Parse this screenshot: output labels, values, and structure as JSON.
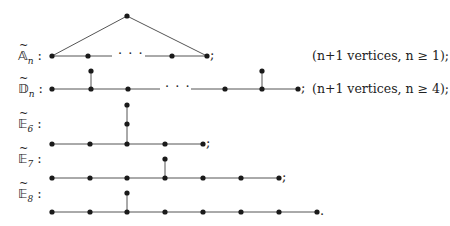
{
  "diagram": {
    "colors": {
      "node": "#1a1a1a",
      "edge": "#555555",
      "text": "#222222"
    },
    "rows": [
      {
        "id": "A_n",
        "label_main": "𝔸",
        "label_sub": "n",
        "label_suffix": ":",
        "note": "(n+1 vertices, n ≥ 1);",
        "terminal": ";",
        "ellipsis": "· · ·"
      },
      {
        "id": "D_n",
        "label_main": "𝔻",
        "label_sub": "n",
        "label_suffix": ":",
        "note": "(n+1 vertices, n ≥ 4);",
        "terminal": ";",
        "ellipsis": "· · ·"
      },
      {
        "id": "E_6",
        "label_main": "𝔼",
        "label_sub": "6",
        "label_suffix": ":",
        "terminal": ";"
      },
      {
        "id": "E_7",
        "label_main": "𝔼",
        "label_sub": "7",
        "label_suffix": ":",
        "terminal": ";"
      },
      {
        "id": "E_8",
        "label_main": "𝔼",
        "label_sub": "8",
        "label_suffix": ":",
        "terminal": "."
      }
    ]
  }
}
